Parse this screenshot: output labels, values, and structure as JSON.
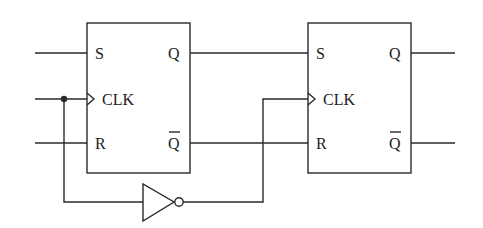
{
  "diagram": {
    "type": "circuit",
    "flipflops": [
      {
        "id": "ff1",
        "pins": {
          "s": "S",
          "clk": "CLK",
          "r": "R",
          "q": "Q",
          "qbar": "Q"
        }
      },
      {
        "id": "ff2",
        "pins": {
          "s": "S",
          "clk": "CLK",
          "r": "R",
          "q": "Q",
          "qbar": "Q"
        }
      }
    ],
    "gates": [
      {
        "id": "inv1",
        "type": "NOT"
      }
    ],
    "colors": {
      "stroke": "#2a2a2a",
      "background": "#ffffff"
    }
  }
}
